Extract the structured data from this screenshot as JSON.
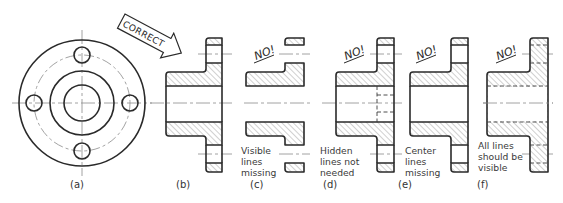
{
  "figure": {
    "callout": "CORRECT",
    "panels": [
      {
        "id": "a",
        "label": "(a)",
        "badge": "",
        "note": []
      },
      {
        "id": "b",
        "label": "(b)",
        "badge": "",
        "note": []
      },
      {
        "id": "c",
        "label": "(c)",
        "badge": "NO!",
        "note": [
          "Visible",
          "lines",
          "missing"
        ]
      },
      {
        "id": "d",
        "label": "(d)",
        "badge": "NO!",
        "note": [
          "Hidden",
          "lines not",
          "needed"
        ]
      },
      {
        "id": "e",
        "label": "(e)",
        "badge": "NO!",
        "note": [
          "Center",
          "lines",
          "missing"
        ]
      },
      {
        "id": "f",
        "label": "(f)",
        "badge": "NO!",
        "note": [
          "All lines",
          "should be",
          "visible"
        ]
      }
    ]
  },
  "colors": {
    "line": "#2a2a2a",
    "centerline": "#8a8a8a",
    "background": "#ffffff"
  }
}
